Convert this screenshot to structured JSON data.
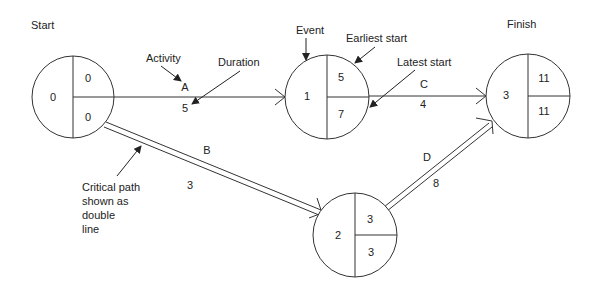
{
  "title_labels": {
    "start": "Start",
    "finish": "Finish"
  },
  "annotations": {
    "activity": "Activity",
    "duration": "Duration",
    "event": "Event",
    "earliest_start": "Earliest start",
    "latest_start": "Latest start",
    "critical_path": [
      "Critical path",
      "shown as",
      "double",
      "line"
    ]
  },
  "nodes": [
    {
      "id": "0",
      "event": "0",
      "earliest": "0",
      "latest": "0"
    },
    {
      "id": "1",
      "event": "1",
      "earliest": "5",
      "latest": "7"
    },
    {
      "id": "2",
      "event": "2",
      "earliest": "3",
      "latest": "3"
    },
    {
      "id": "3",
      "event": "3",
      "earliest": "11",
      "latest": "11"
    }
  ],
  "activities": [
    {
      "name": "A",
      "duration": "5",
      "from": "0",
      "to": "1",
      "critical": false
    },
    {
      "name": "B",
      "duration": "3",
      "from": "0",
      "to": "2",
      "critical": true
    },
    {
      "name": "C",
      "duration": "4",
      "from": "1",
      "to": "3",
      "critical": false
    },
    {
      "name": "D",
      "duration": "8",
      "from": "2",
      "to": "3",
      "critical": true
    }
  ]
}
